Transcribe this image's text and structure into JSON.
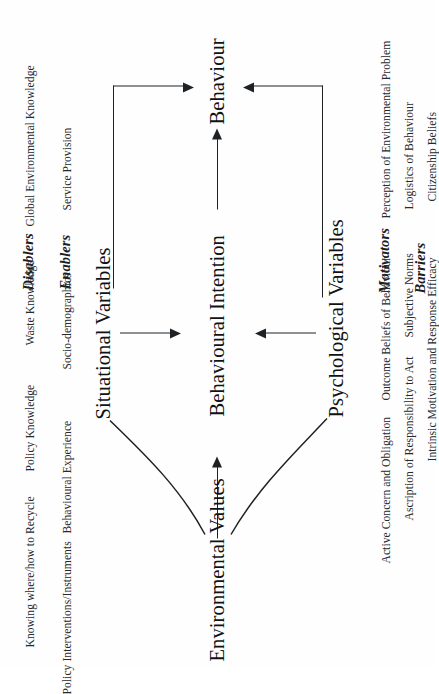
{
  "figure": {
    "title_text": "",
    "ink_color": "#1f2224",
    "text_color": "#1b1d1f",
    "background": "#ffffff",
    "orientation": "rotated-90-ccw"
  },
  "nodes": {
    "environmental_values": "Environmental Values",
    "situational_variables": "Situational Variables",
    "psychological_variables": "Psychological Variables",
    "behavioural_intention": "Behavioural Intention",
    "behaviour": "Behaviour"
  },
  "groups": {
    "enablers": "Enablers",
    "disablers": "Disablers",
    "motivators": "Motivators",
    "barriers": "Barriers"
  },
  "situational": {
    "enablers_items": [
      "Service Provision",
      "Socio-demographics",
      "Behavioural Experience",
      "Policy Interventions/Instruments"
    ],
    "disablers_items": [
      "Global Environmental Knowledge",
      "Waste Knowledge",
      "Policy Knowledge",
      "Knowing where/how to Recycle"
    ]
  },
  "psychological": {
    "motivators_items": [
      "Perception of Environmental Problem",
      "Outcome Beliefs of Behaviour",
      "Active Concern and Obligation"
    ],
    "barriers_items": [
      "Logistics of Behaviour",
      "Subjective Norms",
      "Ascription of Responsibility to Act"
    ],
    "extra_items": [
      "Citizenship Beliefs",
      "Intrinsic Motivation and Response Efficacy"
    ]
  },
  "edges": [
    {
      "id": "values-to-situational",
      "from": "Environmental Values",
      "to": "Situational Variables",
      "style": "curve"
    },
    {
      "id": "values-to-psychological",
      "from": "Environmental Values",
      "to": "Psychological Variables",
      "style": "curve"
    },
    {
      "id": "values-to-intention",
      "from": "Environmental Values",
      "to": "Behavioural Intention",
      "style": "straight-arrow"
    },
    {
      "id": "situational-to-intention",
      "from": "Situational Variables",
      "to": "Behavioural Intention",
      "style": "straight-arrow"
    },
    {
      "id": "psychological-to-intention",
      "from": "Psychological Variables",
      "to": "Behavioural Intention",
      "style": "straight-arrow"
    },
    {
      "id": "intention-to-behaviour",
      "from": "Behavioural Intention",
      "to": "Behaviour",
      "style": "straight-arrow"
    },
    {
      "id": "situational-to-behaviour",
      "from": "Situational Variables",
      "to": "Behaviour",
      "style": "elbow-arrow"
    },
    {
      "id": "psychological-to-behaviour",
      "from": "Psychological Variables",
      "to": "Behaviour",
      "style": "elbow-arrow"
    }
  ]
}
